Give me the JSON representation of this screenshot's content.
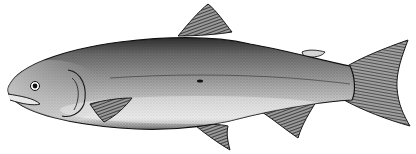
{
  "image": {
    "subject": "salmon illustration",
    "style": "black-and-white engraving",
    "background": "#ffffff",
    "ink": "#1a1a1a",
    "body_tone": "#8a8a8a",
    "belly_tone": "#d8d8d8",
    "fin_tone": "#3a3a3a"
  }
}
